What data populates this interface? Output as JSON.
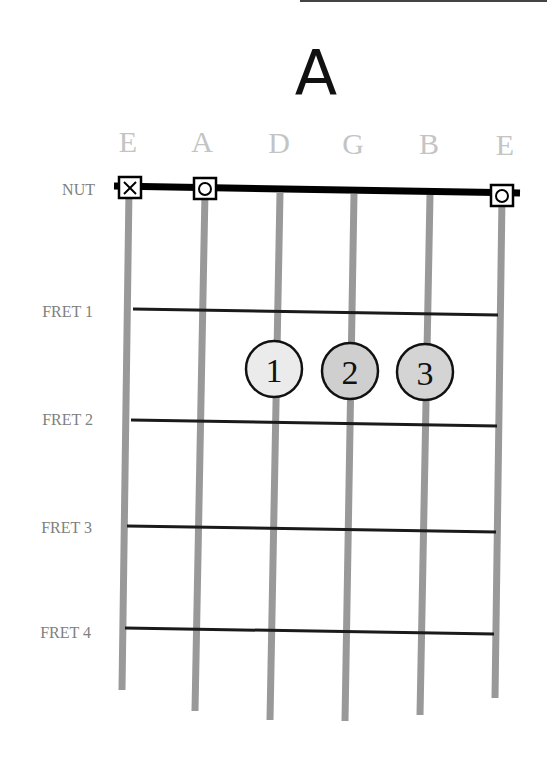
{
  "chord": {
    "name": "A"
  },
  "strings": [
    {
      "label": "E",
      "x_top": 129,
      "x_bottom": 122,
      "y_bottom": 690,
      "status": "muted",
      "status_symbol": "X"
    },
    {
      "label": "A",
      "x_top": 205,
      "x_bottom": 195,
      "y_bottom": 710,
      "status": "open",
      "status_symbol": "O"
    },
    {
      "label": "D",
      "x_top": 280,
      "x_bottom": 270,
      "y_bottom": 720,
      "status": "fretted",
      "status_symbol": ""
    },
    {
      "label": "G",
      "x_top": 354,
      "x_bottom": 345,
      "y_bottom": 720,
      "status": "fretted",
      "status_symbol": ""
    },
    {
      "label": "B",
      "x_top": 430,
      "x_bottom": 420,
      "y_bottom": 715,
      "status": "fretted",
      "status_symbol": ""
    },
    {
      "label": "E",
      "x_top": 502,
      "x_bottom": 495,
      "y_bottom": 698,
      "status": "open",
      "status_symbol": "O"
    }
  ],
  "nut": {
    "label": "NUT"
  },
  "frets": [
    {
      "label": "FRET 1"
    },
    {
      "label": "FRET 2"
    },
    {
      "label": "FRET 3"
    },
    {
      "label": "FRET 4"
    }
  ],
  "fingers": [
    {
      "number": "1",
      "string": "D",
      "fret": 2,
      "fill": "#ebebeb"
    },
    {
      "number": "2",
      "string": "G",
      "fret": 2,
      "fill": "#cfcfcf"
    },
    {
      "number": "3",
      "string": "B",
      "fret": 2,
      "fill": "#d4d4d4"
    }
  ],
  "colors": {
    "string": "#999999",
    "fret": "#1a1a1a",
    "nut": "#000000",
    "label": "#808080",
    "string_label": "#c4c4c4",
    "title": "#111111"
  }
}
